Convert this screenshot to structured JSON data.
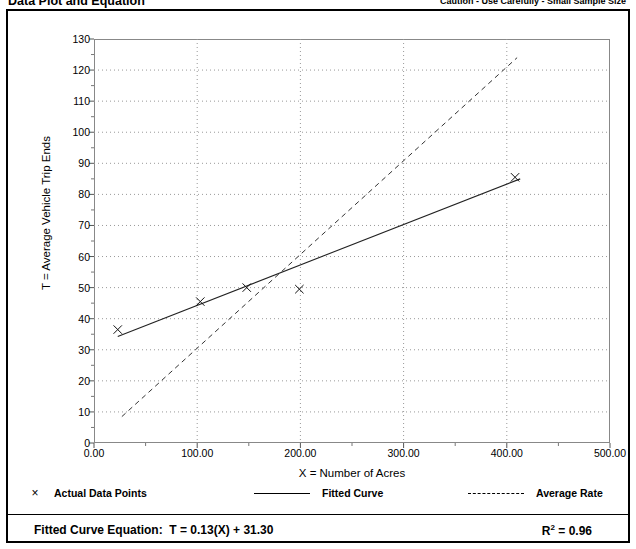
{
  "header": {
    "title": "Data Plot and Equation",
    "note": "Caution - Use Carefully - Small Sample Size"
  },
  "footer": {
    "equation_label": "Fitted Curve Equation:",
    "equation": "T = 0.13(X) + 31.30",
    "r2_label": "R",
    "r2_exponent": "2",
    "r2_value": "= 0.96"
  },
  "legend": {
    "items": [
      {
        "label": "Actual Data Points",
        "symbol": "x-marker",
        "glyph": "×"
      },
      {
        "label": "Fitted Curve",
        "symbol": "solid-line"
      },
      {
        "label": "Average Rate",
        "symbol": "dashed-line"
      }
    ]
  },
  "chart_data": {
    "type": "scatter",
    "title": "Data Plot and Equation",
    "xlabel": "X = Number of Acres",
    "ylabel": "T = Average Vehicle Trip Ends",
    "xlim": [
      0,
      500
    ],
    "ylim": [
      0,
      130
    ],
    "xticks": [
      0,
      100,
      200,
      300,
      400,
      500
    ],
    "xtick_labels": [
      "0.00",
      "100.00",
      "200.00",
      "300.00",
      "400.00",
      "500.00"
    ],
    "xminor_step": 50,
    "yticks": [
      0,
      10,
      20,
      30,
      40,
      50,
      60,
      70,
      80,
      90,
      100,
      110,
      120,
      130
    ],
    "ytick_labels": [
      "0",
      "10",
      "20",
      "30",
      "40",
      "50",
      "60",
      "70",
      "80",
      "90",
      "100",
      "110",
      "120",
      "130"
    ],
    "yminor_step": 5,
    "grid": "dotted-horizontal-and-vertical",
    "legend_position": "below-axes",
    "series": [
      {
        "name": "Actual Data Points",
        "type": "scatter",
        "marker": "x",
        "points": [
          {
            "x": 23,
            "y": 36.5
          },
          {
            "x": 103,
            "y": 45.5
          },
          {
            "x": 148,
            "y": 50.0
          },
          {
            "x": 199,
            "y": 49.5
          },
          {
            "x": 408,
            "y": 85.5
          }
        ]
      },
      {
        "name": "Fitted Curve",
        "type": "line",
        "style": "solid",
        "equation": "T = 0.13(X) + 31.30",
        "slope": 0.13,
        "intercept": 31.3,
        "r2": 0.96,
        "x_start": 23,
        "x_end": 413,
        "y_start": 34.3,
        "y_end": 84.99
      },
      {
        "name": "Average Rate",
        "type": "line",
        "style": "dashed",
        "x_start": 27,
        "x_end": 410,
        "y_start": 8.5,
        "y_end": 124.0
      }
    ]
  }
}
